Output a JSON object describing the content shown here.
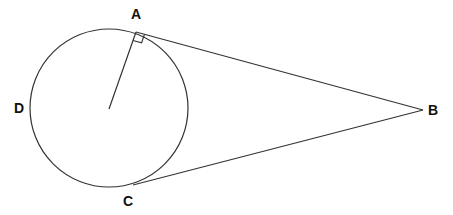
{
  "diagram": {
    "type": "geometry",
    "stroke_color": "#333333",
    "circle": {
      "cx": 109,
      "cy": 108,
      "r": 79
    },
    "center": {
      "x": 109,
      "y": 109
    },
    "points": {
      "A": {
        "label": "A",
        "x": 136,
        "y": 32
      },
      "B": {
        "label": "B",
        "x": 423,
        "y": 110
      },
      "C": {
        "label": "C",
        "x": 133,
        "y": 185
      },
      "D": {
        "label": "D",
        "x": 30,
        "y": 108
      }
    },
    "labels": {
      "A": {
        "text": "A",
        "x": 131,
        "y": 19
      },
      "B": {
        "text": "B",
        "x": 428,
        "y": 115
      },
      "C": {
        "text": "C",
        "x": 123,
        "y": 206
      },
      "D": {
        "text": "D",
        "x": 14,
        "y": 113
      }
    },
    "segments": [
      {
        "name": "radius-OA",
        "from": "center",
        "to": "A"
      },
      {
        "name": "tangent-AB",
        "from": "A",
        "to": "B"
      },
      {
        "name": "tangent-CB",
        "from": "C",
        "to": "B"
      }
    ],
    "right_angle_marker": {
      "at": "A",
      "size": 9
    }
  }
}
